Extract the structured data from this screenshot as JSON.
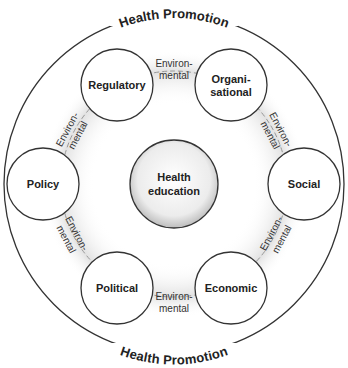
{
  "diagram": {
    "outer_label_top": "Health Promotion",
    "outer_label_bottom": "Health Promotion",
    "center": {
      "line1": "Health",
      "line2": "education"
    },
    "nodes": [
      {
        "id": "regulatory",
        "line1": "Regulatory",
        "line2": ""
      },
      {
        "id": "organisational",
        "line1": "Organi-",
        "line2": "sational"
      },
      {
        "id": "social",
        "line1": "Social",
        "line2": ""
      },
      {
        "id": "economic",
        "line1": "Economic",
        "line2": ""
      },
      {
        "id": "political",
        "line1": "Political",
        "line2": ""
      },
      {
        "id": "policy",
        "line1": "Policy",
        "line2": ""
      }
    ],
    "connectors": [
      {
        "line1": "Environ-",
        "line2": "mental"
      },
      {
        "line1": "Environ-",
        "line2": "mental"
      },
      {
        "line1": "Environ-",
        "line2": "mental"
      },
      {
        "line1": "Environ-",
        "line2": "mental"
      },
      {
        "line1": "Environ-",
        "line2": "mental"
      },
      {
        "line1": "Environ-",
        "line2": "mental"
      }
    ],
    "colors": {
      "stroke": "#333333",
      "ring_shade": "#e6e6e6",
      "center_fill": "#efefef"
    }
  }
}
